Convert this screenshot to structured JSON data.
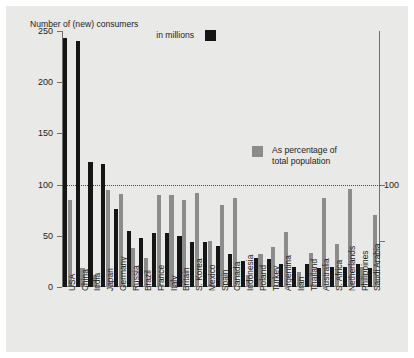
{
  "legends": {
    "black_line1": "Number of (new) consumers",
    "black_line2": "in millions",
    "black_swatch_color": "#151515",
    "gray_line1": "As percentage of",
    "gray_line2": "total population",
    "gray_swatch_color": "#8c8c8c"
  },
  "axis": {
    "y_ticks": [
      "0",
      "50",
      "100",
      "150",
      "200",
      "250"
    ],
    "right_label": "100"
  },
  "chart_data": {
    "type": "bar",
    "title": "Number of (new) consumers in millions",
    "xlabel": "",
    "ylabel": "",
    "ylim": [
      0,
      250
    ],
    "grid": false,
    "legend_position": "inside",
    "annotations": [
      "dotted reference line at 100"
    ],
    "categories": [
      "USA",
      "China",
      "India",
      "Japan",
      "Germany",
      "Russia",
      "Brazil",
      "France",
      "Italy",
      "Britain",
      "S. Korea",
      "Mexico",
      "Spain",
      "Canada",
      "Indonesia",
      "Poland",
      "Turkey",
      "Argentina",
      "Iran",
      "Thailand",
      "Australia",
      "S. Africa",
      "Netherlands",
      "Philippines",
      "Saudi Arabia"
    ],
    "series": [
      {
        "name": "Number of (new) consumers in millions",
        "color": "#151515",
        "values": [
          243,
          240,
          122,
          120,
          76,
          55,
          48,
          53,
          53,
          50,
          44,
          44,
          40,
          32,
          25,
          28,
          27,
          22,
          20,
          22,
          19,
          20,
          20,
          22,
          19
        ]
      },
      {
        "name": "As percentage of total population",
        "color": "#8c8c8c",
        "values": [
          85,
          19,
          12,
          95,
          91,
          38,
          28,
          90,
          90,
          85,
          92,
          45,
          80,
          87,
          12,
          32,
          39,
          54,
          15,
          33,
          87,
          42,
          96,
          20,
          70
        ]
      }
    ]
  }
}
